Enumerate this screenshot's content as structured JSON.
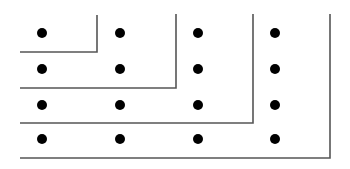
{
  "diagram": {
    "type": "dot-grid-with-nested-gnomons",
    "grid": {
      "rows": 4,
      "cols": 4
    },
    "colors": {
      "background": "#ffffff",
      "dot": "#000000",
      "line": "#555555"
    },
    "dot_columns_x": [
      42,
      120,
      198,
      275
    ],
    "dot_rows_y": [
      33,
      69,
      105,
      139
    ],
    "dot_radius": 5,
    "gnomons": [
      {
        "vertical_x": 97,
        "top_y": 15,
        "bottom_y": 52,
        "left_x": 20
      },
      {
        "vertical_x": 176,
        "top_y": 14,
        "bottom_y": 88,
        "left_x": 20
      },
      {
        "vertical_x": 253,
        "top_y": 14,
        "bottom_y": 123,
        "left_x": 20
      },
      {
        "vertical_x": 330,
        "top_y": 14,
        "bottom_y": 158,
        "left_x": 20
      }
    ]
  }
}
